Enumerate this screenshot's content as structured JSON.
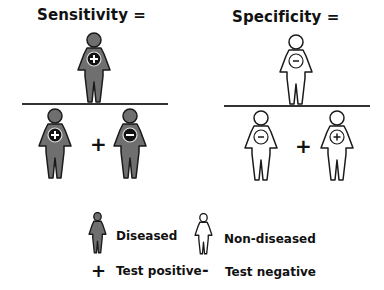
{
  "sensitivity": {
    "title": "Sensitivity =",
    "numerator": {
      "type": "diseased",
      "sign": "+"
    },
    "denominator": [
      {
        "type": "diseased",
        "sign": "+"
      },
      {
        "type": "diseased",
        "sign": "-"
      }
    ],
    "operator": "+"
  },
  "specificity": {
    "title": "Specificity =",
    "numerator": {
      "type": "non-diseased",
      "sign": "-"
    },
    "denominator": [
      {
        "type": "non-diseased",
        "sign": "-"
      },
      {
        "type": "non-diseased",
        "sign": "+"
      }
    ],
    "operator": "+"
  },
  "legend": {
    "diseased_label": "Diseased",
    "non_diseased_label": "Non-diseased",
    "positive_symbol": "+",
    "positive_label": "Test positive",
    "negative_symbol": "-",
    "negative_label": "Test negative"
  },
  "colors": {
    "diseased_fill": "#6f6f6f",
    "non_diseased_fill": "#ffffff",
    "outline": "#1a1a1a",
    "badge_dark": "#111111"
  }
}
